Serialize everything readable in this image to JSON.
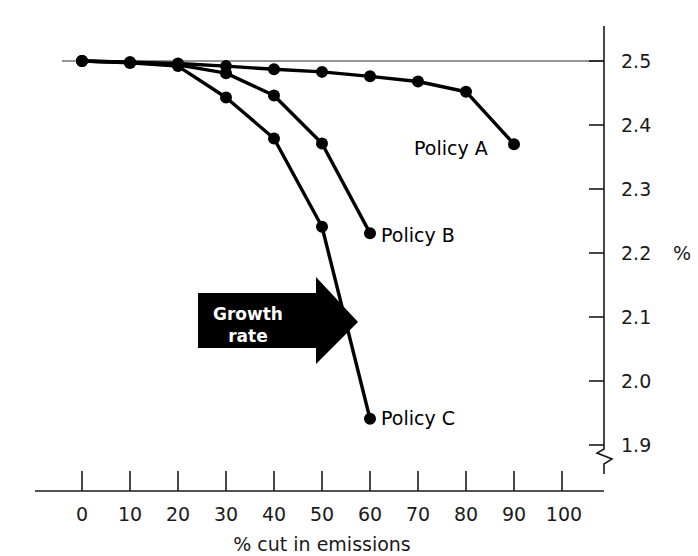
{
  "chart_data": {
    "type": "line",
    "title": "",
    "xlabel": "% cut in emissions",
    "ylabel": "%",
    "xlim": [
      0,
      100
    ],
    "ylim": [
      1.9,
      2.5
    ],
    "grid": false,
    "y_axis_position": "right",
    "y_axis_break": true,
    "x_ticks": [
      "0",
      "10",
      "20",
      "30",
      "40",
      "50",
      "60",
      "70",
      "80",
      "90",
      "100"
    ],
    "x_tick_values": [
      0,
      10,
      20,
      30,
      40,
      50,
      60,
      70,
      80,
      90,
      100
    ],
    "y_ticks": [
      "2.5",
      "2.4",
      "2.3",
      "2.2",
      "2.1",
      "2.0",
      "1.9"
    ],
    "y_tick_values": [
      2.5,
      2.4,
      2.3,
      2.2,
      2.1,
      2.0,
      1.9
    ],
    "reference_line": {
      "value": 2.5,
      "label": ""
    },
    "series": [
      {
        "name": "Policy A",
        "label": "Policy A",
        "color": "#000000",
        "x": [
          0,
          10,
          20,
          30,
          40,
          50,
          60,
          70,
          80,
          90
        ],
        "values": [
          2.5,
          2.498,
          2.496,
          2.492,
          2.487,
          2.483,
          2.476,
          2.468,
          2.452,
          2.37
        ]
      },
      {
        "name": "Policy B",
        "label": "Policy B",
        "color": "#000000",
        "x": [
          0,
          10,
          20,
          30,
          40,
          50,
          60
        ],
        "values": [
          2.5,
          2.498,
          2.494,
          2.481,
          2.446,
          2.371,
          2.231
        ]
      },
      {
        "name": "Policy C",
        "label": "Policy C",
        "color": "#000000",
        "x": [
          0,
          10,
          20,
          30,
          40,
          50,
          60
        ],
        "values": [
          2.5,
          2.497,
          2.492,
          2.443,
          2.379,
          2.241,
          1.941
        ]
      }
    ],
    "annotations": [
      {
        "name": "growth-rate-arrow",
        "line1": "Growth",
        "line2": "rate",
        "direction": "right"
      }
    ]
  },
  "labels": {
    "x_axis_title": "% cut in emissions",
    "y_axis_unit": "%",
    "policy_a": "Policy A",
    "policy_b": "Policy B",
    "policy_c": "Policy C",
    "growth_line1": "Growth",
    "growth_line2": "rate",
    "xt0": "0",
    "xt1": "10",
    "xt2": "20",
    "xt3": "30",
    "xt4": "40",
    "xt5": "50",
    "xt6": "60",
    "xt7": "70",
    "xt8": "80",
    "xt9": "90",
    "xt10": "100",
    "yt0": "2.5",
    "yt1": "2.4",
    "yt2": "2.3",
    "yt3": "2.2",
    "yt4": "2.1",
    "yt5": "2.0",
    "yt6": "1.9"
  }
}
